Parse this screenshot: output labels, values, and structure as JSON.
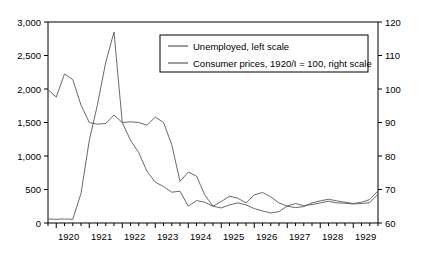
{
  "chart_data": {
    "type": "line",
    "title": "",
    "xlabel": "",
    "ylabel": "",
    "y2label": "",
    "grid": false,
    "legend_position": "top-center",
    "x_tick_labels": [
      "1920",
      "1921",
      "1922",
      "1923",
      "1924",
      "1925",
      "1926",
      "1927",
      "1928",
      "1929"
    ],
    "x_tick_frequency": "quarterly",
    "x": [
      "1919/IV",
      "1920/I",
      "1920/II",
      "1920/III",
      "1920/IV",
      "1921/I",
      "1921/II",
      "1921/III",
      "1921/IV",
      "1922/I",
      "1922/II",
      "1922/III",
      "1922/IV",
      "1923/I",
      "1923/II",
      "1923/III",
      "1923/IV",
      "1924/I",
      "1924/II",
      "1924/III",
      "1924/IV",
      "1925/I",
      "1925/II",
      "1925/III",
      "1925/IV",
      "1926/I",
      "1926/II",
      "1926/III",
      "1926/IV",
      "1927/I",
      "1927/II",
      "1927/III",
      "1927/IV",
      "1928/I",
      "1928/II",
      "1928/III",
      "1928/IV",
      "1929/I",
      "1929/II",
      "1929/III",
      "1929/IV"
    ],
    "ylim": [
      0,
      3000
    ],
    "yticks": [
      0,
      500,
      1000,
      1500,
      2000,
      2500,
      3000
    ],
    "ytick_labels": [
      "0",
      "500",
      "1,000",
      "1,500",
      "2,000",
      "2,500",
      "3,000"
    ],
    "y2lim": [
      60,
      120
    ],
    "y2ticks": [
      60,
      70,
      80,
      90,
      100,
      110,
      120
    ],
    "y2tick_labels": [
      "60",
      "70",
      "80",
      "90",
      "100",
      "110",
      "120"
    ],
    "series": [
      {
        "name": "Unemployed, left scale",
        "axis": "left",
        "color": "#595959",
        "values": [
          60,
          55,
          60,
          55,
          440,
          1230,
          1770,
          2400,
          2850,
          1500,
          1510,
          1500,
          1460,
          1580,
          1500,
          1170,
          620,
          760,
          700,
          420,
          250,
          320,
          400,
          370,
          300,
          420,
          455,
          390,
          300,
          250,
          230,
          245,
          300,
          330,
          355,
          330,
          310,
          290,
          310,
          350,
          480
        ]
      },
      {
        "name": "Consumer prices, 1920/I = 100, right scale",
        "axis": "right",
        "color": "#595959",
        "values": [
          99.8,
          97.6,
          104.5,
          102.8,
          95.2,
          90.0,
          89.5,
          89.7,
          92.2,
          90.0,
          84.7,
          81.0,
          75.4,
          72.2,
          70.9,
          69.2,
          69.5,
          65.0,
          66.7,
          66.2,
          65.0,
          64.5,
          65.4,
          66.0,
          65.4,
          64.3,
          63.6,
          63.0,
          63.4,
          65.1,
          65.8,
          65.2,
          65.5,
          66.0,
          66.5,
          66.0,
          65.9,
          65.7,
          65.8,
          66.1,
          68.6
        ]
      }
    ]
  },
  "legend": {
    "items": [
      {
        "label": "Unemployed, left scale"
      },
      {
        "label": "Consumer prices, 1920/I = 100, right scale"
      }
    ]
  }
}
